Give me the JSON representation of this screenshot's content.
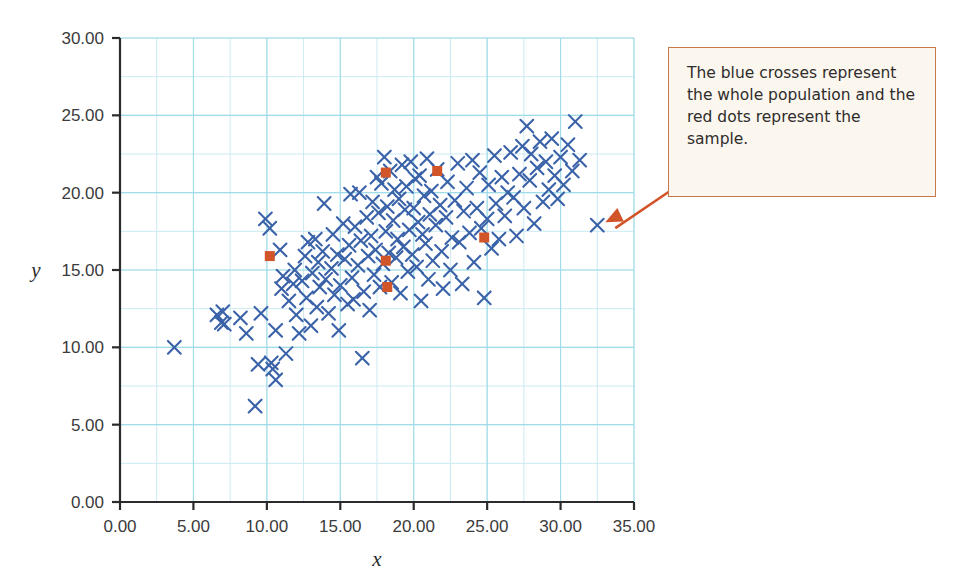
{
  "figure": {
    "width": 953,
    "height": 577,
    "background": "#ffffff"
  },
  "callout": {
    "text": "The blue crosses represent the whole population and the red dots represent the sample.",
    "border_color": "#c9784a",
    "background_color": "#fbf7ef",
    "text_color": "#2f2c2b",
    "arrow_color": "#d2552a",
    "points_to_x": 32.5,
    "points_to_y": 17.9
  },
  "chart_data": {
    "type": "scatter",
    "title": "",
    "xlabel": "x",
    "ylabel": "y",
    "xlim": [
      0,
      35
    ],
    "ylim": [
      0,
      30
    ],
    "xticks": [
      "0.00",
      "5.00",
      "10.00",
      "15.00",
      "20.00",
      "25.00",
      "30.00",
      "35.00"
    ],
    "yticks": [
      "0.00",
      "5.00",
      "10.00",
      "15.00",
      "20.00",
      "25.00",
      "30.00"
    ],
    "xtick_values": [
      0,
      5,
      10,
      15,
      20,
      25,
      30,
      35
    ],
    "ytick_values": [
      0,
      5,
      10,
      15,
      20,
      25,
      30
    ],
    "grid": true,
    "grid_minor_step": 2.5,
    "grid_color": "#9fdbe8",
    "grid_minor_color": "#cbeaf2",
    "axis_color": "#2b2b2b",
    "legend": "none",
    "series": [
      {
        "name": "population",
        "label": "blue crosses",
        "marker": "x",
        "color": "#3a62a8",
        "points": [
          [
            3.7,
            10.0
          ],
          [
            6.6,
            12.1
          ],
          [
            6.9,
            11.6
          ],
          [
            7.0,
            12.3
          ],
          [
            7.1,
            11.5
          ],
          [
            8.2,
            11.9
          ],
          [
            8.6,
            10.9
          ],
          [
            9.2,
            6.2
          ],
          [
            9.4,
            8.9
          ],
          [
            9.6,
            12.2
          ],
          [
            9.9,
            18.3
          ],
          [
            10.2,
            17.7
          ],
          [
            10.3,
            9.0
          ],
          [
            10.4,
            8.6
          ],
          [
            10.6,
            7.9
          ],
          [
            10.6,
            11.1
          ],
          [
            10.9,
            16.3
          ],
          [
            11.0,
            13.8
          ],
          [
            11.1,
            14.6
          ],
          [
            11.3,
            9.6
          ],
          [
            11.5,
            13.0
          ],
          [
            11.8,
            14.1
          ],
          [
            11.9,
            15.0
          ],
          [
            12.0,
            12.1
          ],
          [
            12.2,
            10.9
          ],
          [
            12.4,
            14.3
          ],
          [
            12.6,
            15.9
          ],
          [
            12.7,
            13.2
          ],
          [
            12.8,
            16.8
          ],
          [
            13.0,
            11.4
          ],
          [
            13.1,
            14.8
          ],
          [
            13.3,
            17.0
          ],
          [
            13.4,
            12.6
          ],
          [
            13.5,
            15.5
          ],
          [
            13.6,
            13.9
          ],
          [
            13.8,
            16.2
          ],
          [
            13.9,
            19.3
          ],
          [
            14.0,
            14.4
          ],
          [
            14.2,
            12.2
          ],
          [
            14.4,
            15.1
          ],
          [
            14.5,
            17.3
          ],
          [
            14.6,
            13.4
          ],
          [
            14.8,
            16.0
          ],
          [
            14.9,
            11.1
          ],
          [
            15.0,
            14.0
          ],
          [
            15.2,
            18.0
          ],
          [
            15.3,
            15.7
          ],
          [
            15.5,
            12.8
          ],
          [
            15.6,
            16.6
          ],
          [
            15.7,
            19.9
          ],
          [
            15.8,
            14.5
          ],
          [
            15.9,
            13.1
          ],
          [
            16.0,
            17.8
          ],
          [
            16.2,
            15.3
          ],
          [
            16.3,
            20.0
          ],
          [
            16.4,
            16.9
          ],
          [
            16.5,
            9.3
          ],
          [
            16.6,
            13.6
          ],
          [
            16.8,
            18.4
          ],
          [
            16.9,
            15.9
          ],
          [
            17.0,
            12.4
          ],
          [
            17.1,
            17.2
          ],
          [
            17.2,
            19.4
          ],
          [
            17.3,
            14.7
          ],
          [
            17.4,
            16.3
          ],
          [
            17.5,
            21.0
          ],
          [
            17.6,
            18.7
          ],
          [
            17.7,
            13.9
          ],
          [
            17.8,
            20.6
          ],
          [
            17.9,
            15.4
          ],
          [
            18.0,
            22.3
          ],
          [
            18.1,
            17.5
          ],
          [
            18.2,
            19.1
          ],
          [
            18.3,
            16.1
          ],
          [
            18.4,
            21.4
          ],
          [
            18.5,
            14.2
          ],
          [
            18.6,
            18.2
          ],
          [
            18.7,
            20.2
          ],
          [
            18.8,
            15.8
          ],
          [
            18.9,
            17.0
          ],
          [
            19.0,
            19.6
          ],
          [
            19.1,
            13.5
          ],
          [
            19.2,
            21.8
          ],
          [
            19.3,
            16.5
          ],
          [
            19.4,
            18.9
          ],
          [
            19.5,
            20.4
          ],
          [
            19.6,
            14.9
          ],
          [
            19.7,
            17.6
          ],
          [
            19.8,
            22.0
          ],
          [
            19.9,
            16.0
          ],
          [
            20.0,
            19.0
          ],
          [
            20.1,
            20.9
          ],
          [
            20.2,
            15.2
          ],
          [
            20.3,
            18.1
          ],
          [
            20.4,
            21.1
          ],
          [
            20.5,
            13.0
          ],
          [
            20.6,
            17.3
          ],
          [
            20.7,
            19.8
          ],
          [
            20.8,
            16.7
          ],
          [
            20.9,
            22.2
          ],
          [
            21.0,
            14.4
          ],
          [
            21.1,
            18.6
          ],
          [
            21.2,
            20.1
          ],
          [
            21.3,
            15.6
          ],
          [
            21.5,
            17.9
          ],
          [
            21.6,
            21.5
          ],
          [
            21.8,
            19.2
          ],
          [
            21.9,
            16.2
          ],
          [
            22.0,
            13.8
          ],
          [
            22.2,
            18.4
          ],
          [
            22.3,
            20.7
          ],
          [
            22.5,
            15.0
          ],
          [
            22.6,
            17.1
          ],
          [
            22.8,
            19.5
          ],
          [
            23.0,
            21.9
          ],
          [
            23.1,
            16.8
          ],
          [
            23.3,
            14.1
          ],
          [
            23.4,
            18.8
          ],
          [
            23.6,
            20.3
          ],
          [
            23.8,
            17.4
          ],
          [
            24.0,
            22.1
          ],
          [
            24.1,
            15.5
          ],
          [
            24.3,
            19.0
          ],
          [
            24.5,
            21.3
          ],
          [
            24.6,
            17.7
          ],
          [
            24.8,
            13.2
          ],
          [
            25.0,
            18.3
          ],
          [
            25.1,
            20.5
          ],
          [
            25.3,
            16.4
          ],
          [
            25.5,
            22.4
          ],
          [
            25.6,
            19.3
          ],
          [
            25.8,
            17.0
          ],
          [
            26.0,
            21.0
          ],
          [
            26.2,
            18.5
          ],
          [
            26.4,
            20.0
          ],
          [
            26.6,
            22.6
          ],
          [
            26.8,
            19.7
          ],
          [
            27.0,
            17.2
          ],
          [
            27.2,
            21.2
          ],
          [
            27.4,
            23.0
          ],
          [
            27.5,
            19.0
          ],
          [
            27.7,
            24.3
          ],
          [
            27.9,
            20.8
          ],
          [
            28.0,
            22.5
          ],
          [
            28.2,
            18.0
          ],
          [
            28.4,
            21.6
          ],
          [
            28.6,
            23.3
          ],
          [
            28.8,
            19.4
          ],
          [
            29.0,
            22.0
          ],
          [
            29.2,
            20.2
          ],
          [
            29.4,
            23.5
          ],
          [
            29.6,
            21.1
          ],
          [
            29.8,
            19.6
          ],
          [
            30.0,
            22.3
          ],
          [
            30.2,
            20.5
          ],
          [
            30.5,
            23.1
          ],
          [
            30.8,
            21.4
          ],
          [
            31.0,
            24.6
          ],
          [
            31.3,
            22.1
          ],
          [
            32.5,
            17.9
          ]
        ]
      },
      {
        "name": "sample",
        "label": "red dots",
        "marker": "square",
        "color": "#d2552a",
        "points": [
          [
            10.2,
            15.9
          ],
          [
            18.1,
            21.3
          ],
          [
            21.6,
            21.4
          ],
          [
            18.1,
            15.6
          ],
          [
            18.2,
            13.9
          ],
          [
            24.8,
            17.1
          ]
        ]
      }
    ]
  }
}
